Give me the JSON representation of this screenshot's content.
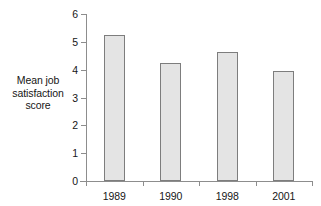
{
  "chart_data": {
    "type": "bar",
    "title": "",
    "subtitle": "",
    "xlabel": "",
    "ylabel": "Mean job satisfaction score",
    "ylabel_lines": [
      "Mean job",
      "satisfaction",
      "score"
    ],
    "categories": [
      "1989",
      "1990",
      "1998",
      "2001"
    ],
    "values": [
      5.25,
      4.25,
      4.65,
      3.95
    ],
    "series": [
      {
        "name": "Mean job satisfaction score",
        "values": [
          5.25,
          4.25,
          4.65,
          3.95
        ]
      }
    ],
    "ylim": [
      0,
      6
    ],
    "xlim": [
      0,
      4
    ],
    "ytick_labels": [
      "0",
      "1",
      "2",
      "3",
      "4",
      "5",
      "6"
    ],
    "ytick_values": [
      0,
      1,
      2,
      3,
      4,
      5,
      6
    ],
    "grid": false,
    "legend": false,
    "legend_position": "none",
    "annotations": [],
    "colors": {
      "bar_fill": "#e4e4e4",
      "bar_stroke": "#7d7d7d",
      "axis": "#8d8d8d",
      "text": "#161616",
      "background": "#ffffff"
    }
  }
}
